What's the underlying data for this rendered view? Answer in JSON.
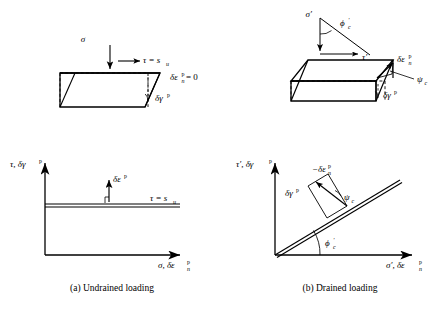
{
  "figure": {
    "background_color": "#ffffff",
    "line_color": "#000000",
    "panels": [
      {
        "id": "undrained",
        "caption": "(a)  Undrained loading",
        "schematic": {
          "name": "undrained-shear-box",
          "labels": {
            "normal_stress": "σ",
            "shear_stress": "τ = s",
            "shear_stress_sub": "u",
            "normal_strain": "δε",
            "normal_strain_sub": "n",
            "normal_strain_sup": "p",
            "normal_strain_value": "= 0",
            "shear_strain": "δγ",
            "shear_strain_sup": "p"
          }
        },
        "plot": {
          "name": "undrained-plot",
          "yaxis": "τ, δγ",
          "yaxis_sup": "p",
          "xaxis": "σ, δε",
          "xaxis_sub": "n",
          "xaxis_sup": "p",
          "line_label": "τ = s",
          "line_label_sub": "u",
          "vector_label": "δε",
          "vector_label_sup": "p"
        }
      },
      {
        "id": "drained",
        "caption": "(b)  Drained loading",
        "schematic": {
          "name": "drained-shear-box",
          "labels": {
            "effective_normal_stress": "σ′",
            "friction_angle": "ϕ",
            "friction_angle_prime": "′",
            "friction_angle_sub": "c",
            "effective_shear_stress": "τ′",
            "normal_strain": "δε",
            "normal_strain_sub": "n",
            "normal_strain_sup": "p",
            "dilation_angle": "ψ",
            "dilation_angle_sub": "c",
            "shear_strain": "δγ",
            "shear_strain_sup": "p"
          }
        },
        "plot": {
          "name": "drained-plot",
          "yaxis": "τ′, δγ",
          "yaxis_sup": "p",
          "xaxis": "σ′, δε",
          "xaxis_sub": "n",
          "xaxis_sup": "p",
          "angle_label": "ϕ",
          "angle_label_prime": "′",
          "angle_label_sub": "c",
          "neg_normal_strain": "−δε",
          "neg_normal_strain_sub": "n",
          "neg_normal_strain_sup": "p",
          "shear_strain": "δγ",
          "shear_strain_sup": "p",
          "dilation_angle": "ψ",
          "dilation_angle_sub": "c"
        }
      }
    ]
  }
}
